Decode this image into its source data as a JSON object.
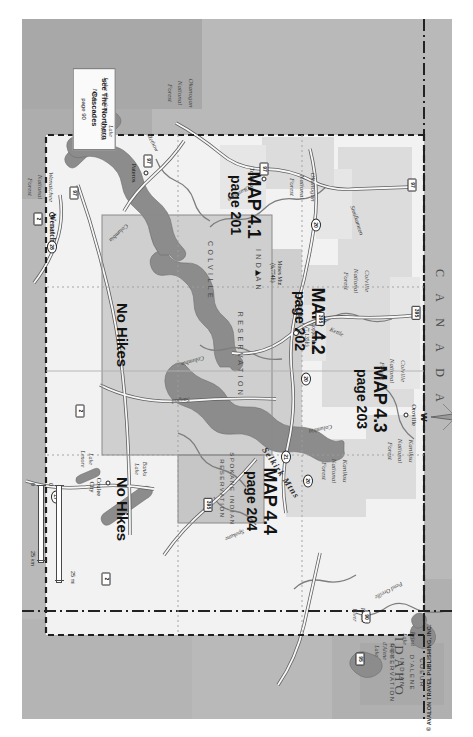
{
  "page": {
    "copyright": "© AVALON TRAVEL PUBLISHING, INC."
  },
  "compass": {
    "north": "N",
    "east": "E",
    "south": "S",
    "west": "W"
  },
  "scale": {
    "miles_zero": "0",
    "miles_label": "25 mi",
    "km_zero": "0",
    "km_label": "25 km"
  },
  "map_sections": [
    {
      "title": "MAP 4.1",
      "page": "page 201"
    },
    {
      "title": "MAP 4.2",
      "page": "page 202"
    },
    {
      "title": "MAP 4.3",
      "page": "page 203"
    },
    {
      "title": "MAP 4.4",
      "page": "page 204"
    }
  ],
  "no_hikes": [
    {
      "label": "No Hikes"
    },
    {
      "label": "No Hikes"
    }
  ],
  "callout": {
    "line1": "see The Northern",
    "line2": "Cascades",
    "page": "page 90"
  },
  "regions": {
    "canada": "C A N A D A",
    "idaho": "IDAHO"
  },
  "reservations": [
    {
      "name": "COLVILLE",
      "name2": "INDIAN",
      "name3": "RESERVATION"
    },
    {
      "line1": "SPOKANE INDIAN",
      "line2": "RESERVATION"
    },
    {
      "line1": "COEUR",
      "line2": "D'ALENE",
      "line3": "INDIAN",
      "line4": "RESERVATION"
    }
  ],
  "forests": [
    {
      "line1": "Okanogan",
      "line2": "National",
      "line3": "Forest"
    },
    {
      "line1": "Okanogan",
      "line2": "National",
      "line3": "Forest"
    },
    {
      "line1": "Colville",
      "line2": "National",
      "line3": "Forest"
    },
    {
      "line1": "Colville",
      "line2": "National",
      "line3": "Forest"
    },
    {
      "line1": "Kaniksu",
      "line2": "National",
      "line3": "Forest"
    },
    {
      "line1": "Kaniksu",
      "line2": "National",
      "line3": "Forest"
    },
    {
      "line1": "Wenatchee",
      "line2": "National",
      "line3": "Forest"
    },
    {
      "line1": "Lake Chelan",
      "line2": "NRA"
    }
  ],
  "peaks": [
    {
      "name": "Copper Butte",
      "elev": "(7,135ft)"
    },
    {
      "name": "Moses Mtn",
      "elev": "(6,774ft)"
    }
  ],
  "cities": [
    {
      "name": "Colville"
    },
    {
      "name": "Oroville"
    },
    {
      "name": "Tonasket"
    },
    {
      "name": "Pateros"
    },
    {
      "name": "Coulee",
      "name2": "City"
    },
    {
      "name": "Wenatchee"
    }
  ],
  "water": [
    {
      "line1": "Priest",
      "line2": "Lake"
    },
    {
      "line1": "Priest",
      "line2": "River"
    },
    {
      "line1": "Coeur",
      "line2": "d'Alene",
      "line3": "Lake"
    },
    {
      "line1": "Banks",
      "line2": "Lake"
    },
    {
      "line1": "Lake",
      "line2": "Lenore"
    },
    {
      "line1": "Lake",
      "line2": "Chelan"
    }
  ],
  "rivers": [
    {
      "name": "Pend Oreille"
    },
    {
      "name": "Columbia"
    },
    {
      "name": "Kettle"
    },
    {
      "name": "Columbia"
    },
    {
      "name": "Okanogan"
    },
    {
      "name": "Methow"
    },
    {
      "name": "Sanpoil"
    },
    {
      "name": "Spokane"
    },
    {
      "name": "Columbia"
    },
    {
      "name": "Similkameen"
    }
  ],
  "ranges": [
    {
      "name": "Selkirk Mtns"
    }
  ],
  "highways": [
    {
      "num": "395"
    },
    {
      "num": "395"
    },
    {
      "num": "395"
    },
    {
      "num": "20"
    },
    {
      "num": "20"
    },
    {
      "num": "20"
    },
    {
      "num": "97"
    },
    {
      "num": "97"
    },
    {
      "num": "97"
    },
    {
      "num": "97"
    },
    {
      "num": "2"
    },
    {
      "num": "2"
    },
    {
      "num": "2"
    },
    {
      "num": "90"
    },
    {
      "num": "95"
    },
    {
      "num": "21"
    },
    {
      "num": "17"
    },
    {
      "num": "28"
    }
  ]
}
